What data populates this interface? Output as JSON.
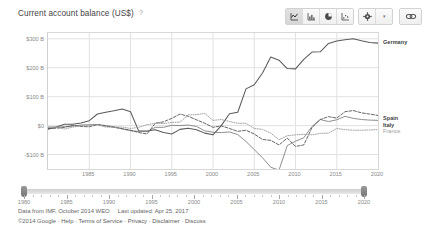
{
  "header": {
    "title": "Current account balance (US$)",
    "help_icon": "help-icon",
    "chart_type_buttons": [
      {
        "name": "line-chart-icon",
        "label": "Line chart",
        "selected": true
      },
      {
        "name": "bar-chart-icon",
        "label": "Bar chart",
        "selected": false
      },
      {
        "name": "pie-chart-icon",
        "label": "Pie chart",
        "selected": false
      },
      {
        "name": "scatter-chart-icon",
        "label": "Scatter chart",
        "selected": false
      }
    ],
    "settings_label": "Settings",
    "settings_icon": "gear-icon",
    "settings_caret": "▾",
    "share_icon": "link-icon"
  },
  "range_slider": {
    "start_label": "1980",
    "end_label": "2020",
    "tick_labels": [
      "1980",
      "1985",
      "1990",
      "1995",
      "2000",
      "2005",
      "2010",
      "2015",
      "2020"
    ],
    "left_handle": "range-handle-left",
    "right_handle": "range-handle-right"
  },
  "footer": {
    "source_prefix": "Data from IMF, October 2014 WEO",
    "updated": "Last updated: Apr 25, 2017",
    "copyright": "©2014 Google",
    "links": [
      "Help",
      "Terms of Service",
      "Privacy",
      "Disclaimer",
      "Discuss"
    ],
    "separator": "-"
  },
  "chart_data": {
    "type": "line",
    "title": "Current account balance (US$)",
    "xlabel": "",
    "ylabel": "",
    "grid": true,
    "legend_position": "right-inline",
    "xlim": [
      1980,
      2020
    ],
    "ylim": [
      -150,
      320
    ],
    "x_ticks": [
      1985,
      1990,
      1995,
      2000,
      2005,
      2010,
      2015,
      2020
    ],
    "y_ticks": [
      -100,
      0,
      100,
      200,
      300
    ],
    "y_tick_labels": [
      "-$100 B",
      "$0",
      "$100 B",
      "$200 B",
      "$300 B"
    ],
    "x": [
      1980,
      1981,
      1982,
      1983,
      1984,
      1985,
      1986,
      1987,
      1988,
      1989,
      1990,
      1991,
      1992,
      1993,
      1994,
      1995,
      1996,
      1997,
      1998,
      1999,
      2000,
      2001,
      2002,
      2003,
      2004,
      2005,
      2006,
      2007,
      2008,
      2009,
      2010,
      2011,
      2012,
      2013,
      2014,
      2015,
      2016,
      2017,
      2018,
      2019,
      2020
    ],
    "series": [
      {
        "name": "Germany",
        "style": "solid",
        "color": "#5a5a5a",
        "values": [
          -13,
          -5,
          5,
          5,
          9,
          17,
          40,
          46,
          51,
          57,
          48,
          -19,
          -19,
          -14,
          -24,
          -29,
          -13,
          -9,
          -14,
          -26,
          -32,
          0,
          41,
          46,
          127,
          141,
          182,
          237,
          226,
          197,
          196,
          229,
          254,
          255,
          284,
          292,
          297,
          300,
          293,
          287,
          285
        ]
      },
      {
        "name": "Spain",
        "style": "solid-thin",
        "color": "#7a7a7a",
        "values": [
          -5,
          -5,
          -4,
          -2,
          2,
          3,
          4,
          0,
          -4,
          -11,
          -18,
          -20,
          -21,
          -6,
          -6,
          1,
          0,
          2,
          -3,
          -18,
          -23,
          -24,
          -22,
          -31,
          -55,
          -83,
          -111,
          -144,
          -154,
          -69,
          -54,
          -42,
          -3,
          21,
          14,
          20,
          32,
          25,
          21,
          19,
          18
        ]
      },
      {
        "name": "Italy",
        "style": "dashed",
        "color": "#555",
        "values": [
          -10,
          -9,
          -6,
          1,
          -3,
          -4,
          3,
          -2,
          -6,
          -11,
          -16,
          -24,
          -29,
          8,
          13,
          25,
          40,
          32,
          20,
          8,
          -6,
          -1,
          -10,
          -20,
          -16,
          -29,
          -48,
          -51,
          -67,
          -43,
          -72,
          -67,
          -7,
          21,
          31,
          26,
          48,
          52,
          44,
          40,
          35
        ]
      },
      {
        "name": "France",
        "style": "dotted",
        "color": "#9b9b9b",
        "values": [
          -6,
          -6,
          -12,
          -5,
          -1,
          -1,
          3,
          -5,
          -5,
          -5,
          -10,
          -6,
          3,
          8,
          7,
          11,
          12,
          37,
          38,
          42,
          18,
          21,
          14,
          8,
          8,
          -10,
          -13,
          -26,
          -49,
          -35,
          -32,
          -30,
          -32,
          -27,
          -26,
          -10,
          -14,
          -16,
          -16,
          -15,
          -14
        ]
      }
    ],
    "inline_labels": [
      {
        "name": "Germany",
        "value_2020": 285
      },
      {
        "name": "Spain",
        "value_2020": 18
      },
      {
        "name": "Italy",
        "value_2020": 35
      },
      {
        "name": "France",
        "value_2020": -14
      }
    ]
  }
}
